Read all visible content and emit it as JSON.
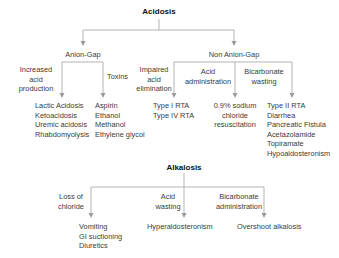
{
  "acidosis": {
    "title": "Acidosis",
    "anion_gap": {
      "label": "Anion-Gap",
      "branches": [
        {
          "label": [
            "Increased",
            "acid",
            "production"
          ],
          "items": [
            "Lactic Acidosis",
            "Ketoacidosis",
            "Uremic acidosis",
            "Rhabdomyolysis"
          ]
        },
        {
          "label": [
            "Toxins"
          ],
          "items": [
            "Aspirin",
            "Ethanol",
            "Methanol",
            "Ethylene glycol"
          ]
        }
      ]
    },
    "non_anion_gap": {
      "label": "Non Anion-Gap",
      "branches": [
        {
          "label": [
            "Impaired",
            "acid",
            "elimination"
          ],
          "items": [
            "Type I RTA",
            "Type IV RTA"
          ]
        },
        {
          "label": [
            "Acid",
            "administration"
          ],
          "items": [
            "0.9% sodium",
            "chloride",
            "resuscitation"
          ]
        },
        {
          "label": [
            "Bicarbonate",
            "wasting"
          ],
          "items": [
            "Type II RTA",
            "Diarrhea",
            "Pancreatic Fistula",
            "Acetazolamide",
            "Topiramate",
            "Hypoaldosteronism"
          ]
        }
      ]
    }
  },
  "alkalosis": {
    "title": "Alkalosis",
    "branches": [
      {
        "label": [
          "Loss of",
          "chloride"
        ],
        "items": [
          "Vomiting",
          "GI suctioning",
          "Diuretics"
        ]
      },
      {
        "label": [
          "Acid",
          "wasting"
        ],
        "items": [
          "Hyperaldosteronism"
        ]
      },
      {
        "label": [
          "Bicarbonate",
          "administration"
        ],
        "items": [
          "Overshoot alkalosis"
        ]
      }
    ]
  },
  "colors": {
    "line": "#b3b3b3",
    "arrow": "#9a9a9a",
    "text": "#3a3a3a",
    "title": "#111111"
  }
}
